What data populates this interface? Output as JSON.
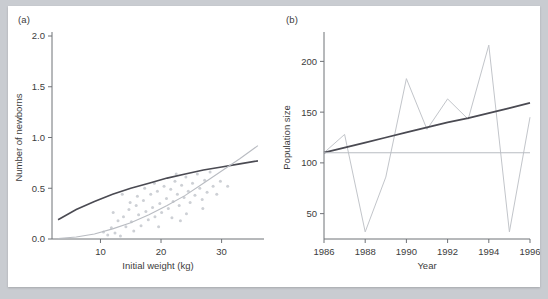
{
  "figure": {
    "panel_a_label": "(a)",
    "panel_b_label": "(b)",
    "background_color": "#c9ccd1",
    "card_color": "#ffffff"
  },
  "chart_data": [
    {
      "id": "panel-a",
      "panel": "(a)",
      "type": "scatter",
      "title": "",
      "xlabel": "Initial weight (kg)",
      "ylabel": "Number of newborns",
      "xlim": [
        2,
        37
      ],
      "ylim": [
        0.0,
        2.0
      ],
      "xticks": [
        10,
        20,
        30
      ],
      "xtick_labels": [
        "10",
        "20",
        "30"
      ],
      "yticks": [
        0.0,
        0.5,
        1.0,
        1.5,
        2.0
      ],
      "ytick_labels": [
        "0.0",
        "0.5",
        "1.0",
        "1.5",
        "2.0"
      ],
      "grid": false,
      "legend": "none",
      "colors": {
        "dark_curve": "#4a4a52",
        "light_curve": "#b9bcc2",
        "points": "#cdd0d5"
      },
      "series": [
        {
          "name": "observations",
          "kind": "scatter",
          "points": [
            [
              10.5,
              0.07
            ],
            [
              11.2,
              0.04
            ],
            [
              11.8,
              0.11
            ],
            [
              12.4,
              0.06
            ],
            [
              12.9,
              0.18
            ],
            [
              13.3,
              0.03
            ],
            [
              13.8,
              0.22
            ],
            [
              14.2,
              0.12
            ],
            [
              14.7,
              0.29
            ],
            [
              15.1,
              0.17
            ],
            [
              15.5,
              0.08
            ],
            [
              15.9,
              0.33
            ],
            [
              16.3,
              0.24
            ],
            [
              16.7,
              0.13
            ],
            [
              17.1,
              0.38
            ],
            [
              17.5,
              0.27
            ],
            [
              17.9,
              0.19
            ],
            [
              18.3,
              0.44
            ],
            [
              18.6,
              0.31
            ],
            [
              19.0,
              0.22
            ],
            [
              19.4,
              0.47
            ],
            [
              19.8,
              0.35
            ],
            [
              20.1,
              0.26
            ],
            [
              20.5,
              0.52
            ],
            [
              20.9,
              0.4
            ],
            [
              21.2,
              0.3
            ],
            [
              21.6,
              0.49
            ],
            [
              22.0,
              0.37
            ],
            [
              22.3,
              0.57
            ],
            [
              22.7,
              0.44
            ],
            [
              23.0,
              0.33
            ],
            [
              23.4,
              0.53
            ],
            [
              23.8,
              0.41
            ],
            [
              24.1,
              0.61
            ],
            [
              24.5,
              0.47
            ],
            [
              24.8,
              0.36
            ],
            [
              25.2,
              0.55
            ],
            [
              25.6,
              0.43
            ],
            [
              26.0,
              0.64
            ],
            [
              26.4,
              0.5
            ],
            [
              26.8,
              0.39
            ],
            [
              27.2,
              0.58
            ],
            [
              27.6,
              0.46
            ],
            [
              28.1,
              0.66
            ],
            [
              28.6,
              0.52
            ],
            [
              29.2,
              0.44
            ],
            [
              18.9,
              0.55
            ],
            [
              21.8,
              0.21
            ],
            [
              16.1,
              0.42
            ],
            [
              24.2,
              0.25
            ],
            [
              19.6,
              0.12
            ],
            [
              22.5,
              0.64
            ],
            [
              14.9,
              0.36
            ],
            [
              26.9,
              0.3
            ],
            [
              12.1,
              0.26
            ],
            [
              29.8,
              0.57
            ],
            [
              13.6,
              0.44
            ],
            [
              31.0,
              0.52
            ],
            [
              23.2,
              0.18
            ],
            [
              17.3,
              0.5
            ]
          ]
        },
        {
          "name": "fitted-curve-upper",
          "kind": "curve",
          "description": "concave increasing fit",
          "points": [
            [
              3.0,
              0.19
            ],
            [
              6.0,
              0.29
            ],
            [
              9.0,
              0.37
            ],
            [
              12.0,
              0.44
            ],
            [
              15.0,
              0.5
            ],
            [
              18.0,
              0.55
            ],
            [
              21.0,
              0.6
            ],
            [
              24.0,
              0.64
            ],
            [
              27.0,
              0.68
            ],
            [
              30.0,
              0.71
            ],
            [
              33.0,
              0.74
            ],
            [
              36.0,
              0.77
            ]
          ]
        },
        {
          "name": "fitted-curve-lower",
          "kind": "curve",
          "description": "convex increasing fit",
          "points": [
            [
              3.0,
              0.005
            ],
            [
              6.0,
              0.02
            ],
            [
              9.0,
              0.05
            ],
            [
              12.0,
              0.1
            ],
            [
              15.0,
              0.16
            ],
            [
              18.0,
              0.24
            ],
            [
              21.0,
              0.33
            ],
            [
              24.0,
              0.43
            ],
            [
              27.0,
              0.55
            ],
            [
              30.0,
              0.67
            ],
            [
              33.0,
              0.79
            ],
            [
              36.0,
              0.92
            ]
          ]
        }
      ]
    },
    {
      "id": "panel-b",
      "panel": "(b)",
      "type": "line",
      "title": "",
      "xlabel": "Year",
      "ylabel": "Population size",
      "xlim": [
        1986,
        1996
      ],
      "ylim": [
        25,
        225
      ],
      "xticks": [
        1986,
        1988,
        1990,
        1992,
        1994,
        1996
      ],
      "xtick_labels": [
        "1986",
        "1988",
        "1990",
        "1992",
        "1994",
        "1996"
      ],
      "yticks": [
        50,
        100,
        150,
        200
      ],
      "ytick_labels": [
        "50",
        "100",
        "150",
        "200"
      ],
      "grid": false,
      "legend": "none",
      "colors": {
        "observed": "#c2c5ca",
        "trend_line": "#4a4a52",
        "flat_line": "#b9bcc2"
      },
      "x": [
        1986,
        1987,
        1988,
        1989,
        1990,
        1991,
        1992,
        1993,
        1994,
        1995,
        1996
      ],
      "series": [
        {
          "name": "observed population",
          "kind": "line",
          "values": [
            110,
            128,
            32,
            86,
            183,
            133,
            163,
            143,
            216,
            32,
            145
          ]
        },
        {
          "name": "increasing trend",
          "kind": "line",
          "values": [
            110,
            115,
            120,
            125,
            130,
            135,
            140,
            144,
            149,
            154,
            159
          ]
        },
        {
          "name": "flat trend",
          "kind": "line",
          "values": [
            110,
            110,
            110,
            110,
            110,
            110,
            110,
            110,
            110,
            110,
            110
          ]
        }
      ]
    }
  ]
}
